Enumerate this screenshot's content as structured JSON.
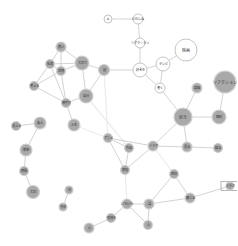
{
  "graph": {
    "type": "co-occurrence network",
    "colors": {
      "gray_node": "#a9a9a9",
      "white_node": "#ffffff",
      "edge": "#c8c8c8"
    },
    "nodes": [
      {
        "id": "n1",
        "label": "A",
        "x": 108,
        "y": 19,
        "r": 4,
        "style": "white"
      },
      {
        "id": "n2",
        "label": "いわしね",
        "x": 138,
        "y": 19,
        "r": 5,
        "style": "white"
      },
      {
        "id": "n3",
        "label": "リアクション",
        "x": 140,
        "y": 43,
        "r": 5,
        "style": "white"
      },
      {
        "id": "n4",
        "label": "映画",
        "x": 186,
        "y": 50,
        "r": 11,
        "style": "white"
      },
      {
        "id": "n5",
        "label": "好きを",
        "x": 140,
        "y": 70,
        "r": 7,
        "style": "white"
      },
      {
        "id": "n6",
        "label": "テレビ",
        "x": 163,
        "y": 64,
        "r": 7,
        "style": "white"
      },
      {
        "id": "n7",
        "label": "書く",
        "x": 160,
        "y": 88,
        "r": 5,
        "style": "white"
      },
      {
        "id": "n8",
        "label": "高級",
        "x": 197,
        "y": 88,
        "r": 5,
        "style": "gray"
      },
      {
        "id": "n9",
        "label": "リアクション",
        "x": 225,
        "y": 82,
        "r": 11,
        "style": "gray"
      },
      {
        "id": "n10",
        "label": "好き",
        "x": 183,
        "y": 117,
        "r": 9,
        "style": "gray"
      },
      {
        "id": "n11",
        "label": "個別",
        "x": 219,
        "y": 117,
        "r": 7,
        "style": "gray"
      },
      {
        "id": "n12",
        "label": "思い",
        "x": 61,
        "y": 47,
        "r": 5,
        "style": "gray"
      },
      {
        "id": "n13",
        "label": "私達",
        "x": 50,
        "y": 64,
        "r": 4.5,
        "style": "gray"
      },
      {
        "id": "n14",
        "label": "大切さ",
        "x": 82,
        "y": 63,
        "r": 7,
        "style": "gray"
      },
      {
        "id": "n15",
        "label": "世界",
        "x": 61,
        "y": 71,
        "r": 4.5,
        "style": "gray"
      },
      {
        "id": "n16",
        "label": "国",
        "x": 104,
        "y": 70,
        "r": 5.5,
        "style": "gray"
      },
      {
        "id": "n17",
        "label": "考える",
        "x": 34,
        "y": 86,
        "r": 4.5,
        "style": "gray"
      },
      {
        "id": "n18",
        "label": "自分",
        "x": 86,
        "y": 96,
        "r": 7,
        "style": "gray"
      },
      {
        "id": "n19",
        "label": "相手方",
        "x": 66,
        "y": 103,
        "r": 4.5,
        "style": "gray"
      },
      {
        "id": "n20",
        "label": "人生",
        "x": 74,
        "y": 125,
        "r": 6,
        "style": "gray"
      },
      {
        "id": "n21",
        "label": "見える",
        "x": 16,
        "y": 126,
        "r": 4.5,
        "style": "gray"
      },
      {
        "id": "n22",
        "label": "友人",
        "x": 40,
        "y": 123,
        "r": 6,
        "style": "gray"
      },
      {
        "id": "n23",
        "label": "家族",
        "x": 26,
        "y": 150,
        "r": 6,
        "style": "gray"
      },
      {
        "id": "n24",
        "label": "時間",
        "x": 24,
        "y": 171,
        "r": 4.5,
        "style": "gray"
      },
      {
        "id": "n25",
        "label": "大切",
        "x": 33,
        "y": 192,
        "r": 6.5,
        "style": "gray"
      },
      {
        "id": "n26",
        "label": "日",
        "x": 69,
        "y": 190,
        "r": 4,
        "style": "gray"
      },
      {
        "id": "n27",
        "label": "今日",
        "x": 63,
        "y": 207,
        "r": 4,
        "style": "gray"
      },
      {
        "id": "n28",
        "label": "アニメ",
        "x": 108,
        "y": 138,
        "r": 4.5,
        "style": "gray"
      },
      {
        "id": "n29",
        "label": "作品",
        "x": 129,
        "y": 148,
        "r": 4.5,
        "style": "gray"
      },
      {
        "id": "n30",
        "label": "表現",
        "x": 125,
        "y": 170,
        "r": 4.5,
        "style": "gray"
      },
      {
        "id": "n31",
        "label": "ドラマ",
        "x": 153,
        "y": 146,
        "r": 5,
        "style": "gray"
      },
      {
        "id": "n32",
        "label": "見る",
        "x": 187,
        "y": 147,
        "r": 5,
        "style": "gray"
      },
      {
        "id": "n33",
        "label": "観る",
        "x": 218,
        "y": 148,
        "r": 4.5,
        "style": "gray"
      },
      {
        "id": "n34",
        "label": "面白",
        "x": 174,
        "y": 174,
        "r": 4.5,
        "style": "gray"
      },
      {
        "id": "n35",
        "label": "感じる",
        "x": 190,
        "y": 198,
        "r": 5,
        "style": "gray"
      },
      {
        "id": "n36",
        "label": "ビデオ",
        "x": 230,
        "y": 186,
        "r": 4,
        "style": "gray",
        "boxed": true
      },
      {
        "id": "n37",
        "label": "いろいろ",
        "x": 127,
        "y": 204,
        "r": 5,
        "style": "gray"
      },
      {
        "id": "n38",
        "label": "話",
        "x": 149,
        "y": 204,
        "r": 5,
        "style": "gray"
      },
      {
        "id": "n39",
        "label": "人",
        "x": 148,
        "y": 225,
        "r": 4.5,
        "style": "gray"
      },
      {
        "id": "n40",
        "label": "気持ち",
        "x": 111,
        "y": 218,
        "r": 4.5,
        "style": "gray"
      },
      {
        "id": "n41",
        "label": "心",
        "x": 89,
        "y": 228,
        "r": 5,
        "style": "gray"
      }
    ],
    "edges": [
      [
        "n1",
        "n2"
      ],
      [
        "n2",
        "n3"
      ],
      [
        "n3",
        "n5"
      ],
      [
        "n5",
        "n6"
      ],
      [
        "n5",
        "n7"
      ],
      [
        "n6",
        "n7"
      ],
      [
        "n6",
        "n4"
      ],
      [
        "n5",
        "n16"
      ],
      [
        "n7",
        "n10"
      ],
      [
        "n8",
        "n10"
      ],
      [
        "n10",
        "n11"
      ],
      [
        "n9",
        "n11"
      ],
      [
        "n12",
        "n13"
      ],
      [
        "n12",
        "n14"
      ],
      [
        "n13",
        "n14"
      ],
      [
        "n13",
        "n15"
      ],
      [
        "n13",
        "n17"
      ],
      [
        "n15",
        "n17"
      ],
      [
        "n15",
        "n14"
      ],
      [
        "n13",
        "n19"
      ],
      [
        "n15",
        "n19"
      ],
      [
        "n14",
        "n18"
      ],
      [
        "n14",
        "n16"
      ],
      [
        "n16",
        "n18"
      ],
      [
        "n12",
        "n15"
      ],
      [
        "n17",
        "n19"
      ],
      [
        "n18",
        "n19"
      ],
      [
        "n19",
        "n20"
      ],
      [
        "n21",
        "n22"
      ],
      [
        "n22",
        "n23"
      ],
      [
        "n23",
        "n24"
      ],
      [
        "n24",
        "n25"
      ],
      [
        "n26",
        "n27"
      ],
      [
        "n28",
        "n29"
      ],
      [
        "n28",
        "n30"
      ],
      [
        "n29",
        "n30"
      ],
      [
        "n28",
        "n31"
      ],
      [
        "n30",
        "n31"
      ],
      [
        "n31",
        "n32"
      ],
      [
        "n32",
        "n33"
      ],
      [
        "n10",
        "n31"
      ],
      [
        "n10",
        "n32"
      ],
      [
        "n34",
        "n38"
      ],
      [
        "n34",
        "n35"
      ],
      [
        "n35",
        "n38"
      ],
      [
        "n35",
        "n36"
      ],
      [
        "n37",
        "n38"
      ],
      [
        "n37",
        "n39"
      ],
      [
        "n38",
        "n39"
      ],
      [
        "n37",
        "n40"
      ],
      [
        "n40",
        "n41"
      ]
    ],
    "faint_edges": [
      [
        "n16",
        "n28"
      ],
      [
        "n20",
        "n28"
      ],
      [
        "n31",
        "n34"
      ],
      [
        "n30",
        "n37"
      ],
      [
        "n18",
        "n29"
      ]
    ]
  }
}
